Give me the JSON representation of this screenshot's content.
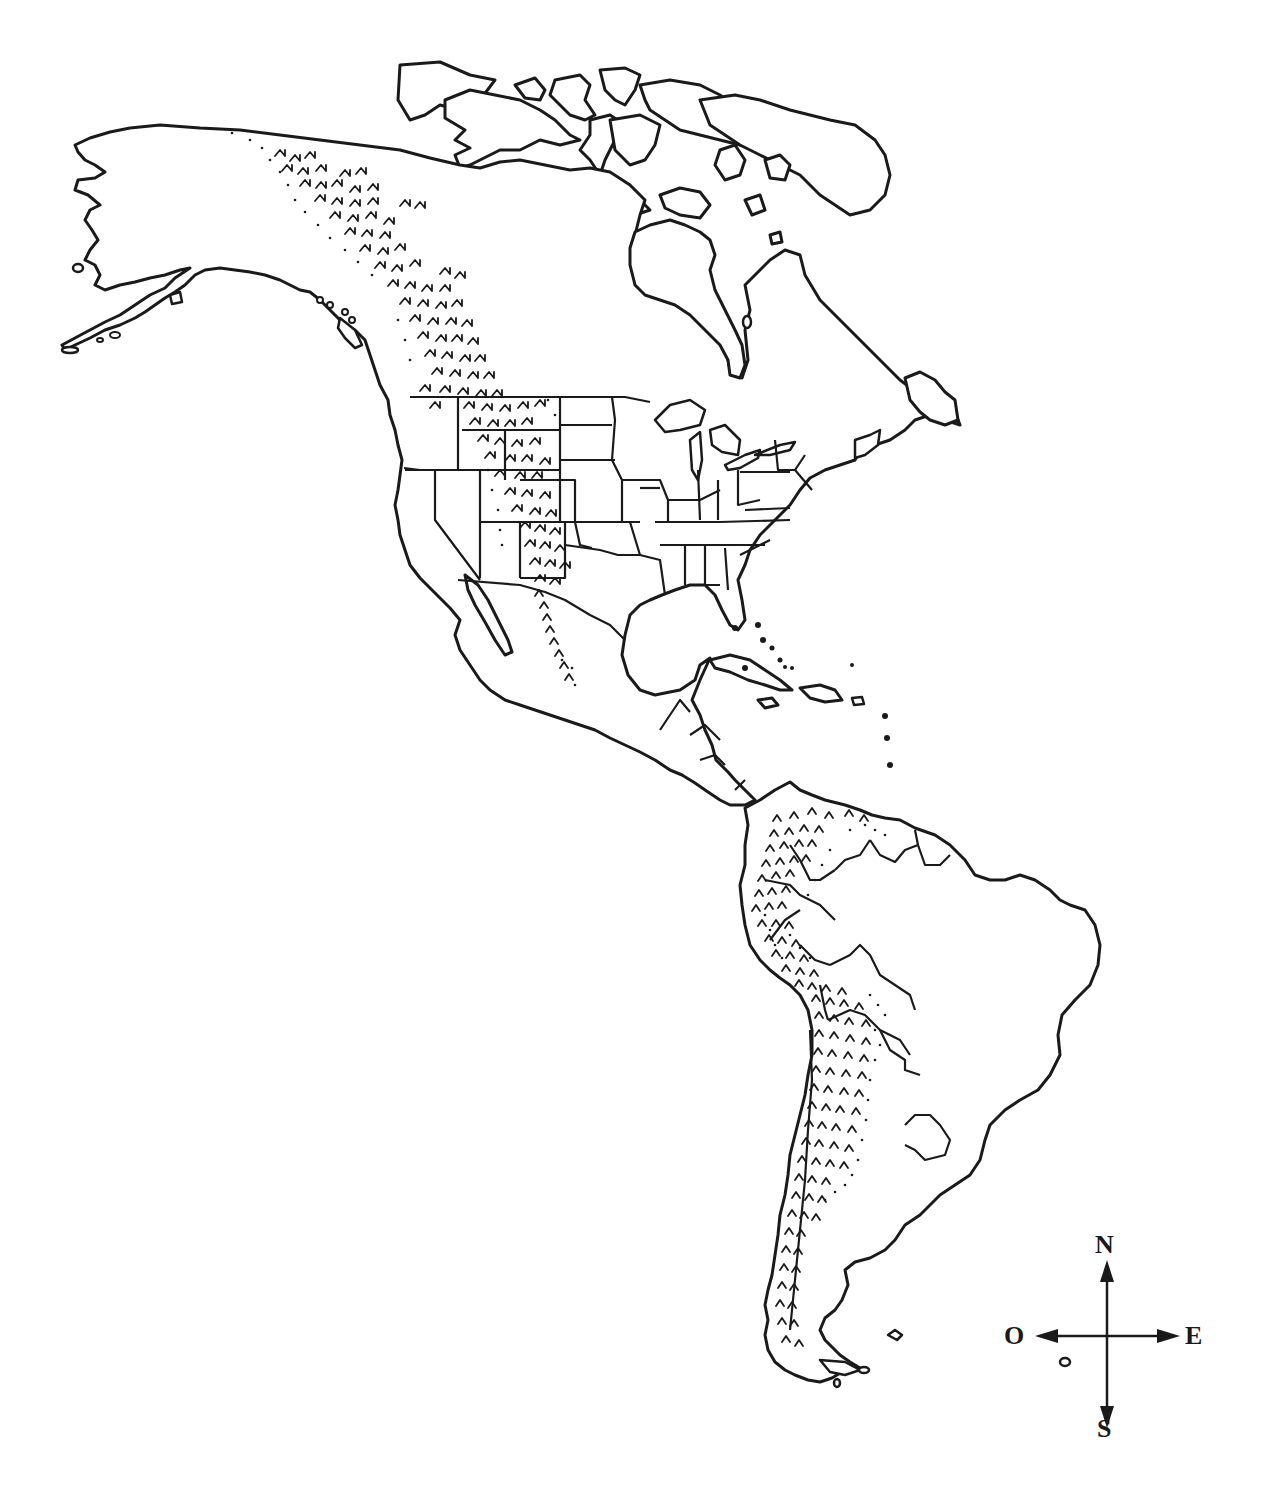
{
  "map": {
    "title": "",
    "region": "Americas (North, Central and South America)",
    "style": "black-and-white outline",
    "ink_color": "#1a1a1a",
    "background_color": "#ffffff",
    "features": {
      "mountain_ranges": [
        {
          "name": "rocky-mountains",
          "symbol": "hatched-peaks-and-dots"
        },
        {
          "name": "sierra-madre",
          "symbol": "hatched-peaks-and-dots"
        },
        {
          "name": "andes",
          "symbol": "hatched-peaks-and-dots"
        }
      ],
      "political_borders": [
        "us-states",
        "canada",
        "mexico",
        "central-america",
        "south-america-countries"
      ]
    }
  },
  "compass": {
    "north": "N",
    "west": "O",
    "east": "E",
    "south": "S"
  }
}
